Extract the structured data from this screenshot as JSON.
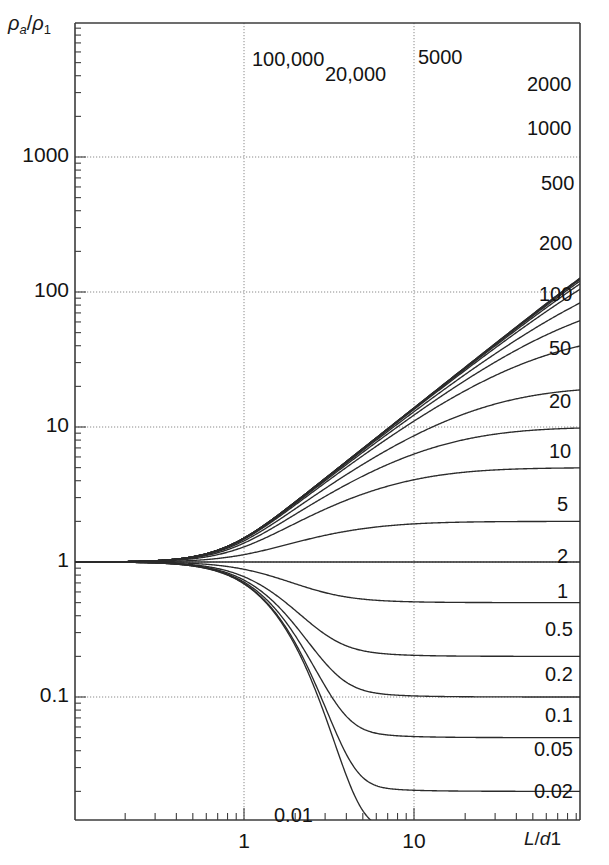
{
  "chart_data": {
    "type": "line",
    "title": "",
    "xlabel": "L/d1",
    "ylabel": "rho_a/rho_1",
    "xscale": "log",
    "yscale": "log",
    "xlim": [
      0.09,
      100
    ],
    "ylim": [
      0.005,
      20000
    ],
    "grid": true,
    "legend_position": "inline-right",
    "x_ticks": [
      {
        "value": 1,
        "label": "1"
      },
      {
        "value": 10,
        "label": "10"
      }
    ],
    "y_ticks": [
      {
        "value": 1000,
        "label": "1000"
      },
      {
        "value": 100,
        "label": "100"
      },
      {
        "value": 10,
        "label": "10"
      },
      {
        "value": 1,
        "label": "1"
      },
      {
        "value": 0.1,
        "label": "0.1"
      }
    ],
    "series": [
      {
        "name": "100,000",
        "k": 100000,
        "asymptote": 100000,
        "label_x": 252,
        "label_y": 48
      },
      {
        "name": "20,000",
        "k": 20000,
        "asymptote": 20000,
        "label_x": 325,
        "label_y": 63
      },
      {
        "name": "5000",
        "k": 5000,
        "asymptote": 5000,
        "label_x": 418,
        "label_y": 46
      },
      {
        "name": "2000",
        "k": 2000,
        "asymptote": 2000,
        "label_x": 527,
        "label_y": 73
      },
      {
        "name": "1000",
        "k": 1000,
        "asymptote": 1000,
        "label_x": 527,
        "label_y": 117
      },
      {
        "name": "500",
        "k": 500,
        "asymptote": 500,
        "label_x": 541,
        "label_y": 172
      },
      {
        "name": "200",
        "k": 200,
        "asymptote": 200,
        "label_x": 539,
        "label_y": 232
      },
      {
        "name": "100",
        "k": 100,
        "asymptote": 100,
        "label_x": 539,
        "label_y": 283
      },
      {
        "name": "50",
        "k": 50,
        "asymptote": 50,
        "label_x": 549,
        "label_y": 337
      },
      {
        "name": "20",
        "k": 20,
        "asymptote": 20,
        "label_x": 549,
        "label_y": 390
      },
      {
        "name": "10",
        "k": 10,
        "asymptote": 10,
        "label_x": 549,
        "label_y": 440
      },
      {
        "name": "5",
        "k": 5,
        "asymptote": 5,
        "label_x": 557,
        "label_y": 493
      },
      {
        "name": "2",
        "k": 2,
        "asymptote": 2,
        "label_x": 557,
        "label_y": 545
      },
      {
        "name": "1",
        "k": 1,
        "asymptote": 1,
        "label_x": 557,
        "label_y": 580
      },
      {
        "name": "0.5",
        "k": 0.5,
        "asymptote": 0.5,
        "label_x": 545,
        "label_y": 618
      },
      {
        "name": "0.2",
        "k": 0.2,
        "asymptote": 0.2,
        "label_x": 545,
        "label_y": 663
      },
      {
        "name": "0.1",
        "k": 0.1,
        "asymptote": 0.1,
        "label_x": 545,
        "label_y": 704
      },
      {
        "name": "0.05",
        "k": 0.05,
        "asymptote": 0.05,
        "label_x": 534,
        "label_y": 738
      },
      {
        "name": "0.02",
        "k": 0.02,
        "asymptote": 0.02,
        "label_x": 534,
        "label_y": 780
      },
      {
        "name": "0.01",
        "k": 0.01,
        "asymptote": 0.01,
        "label_x": 274,
        "label_y": 804
      }
    ]
  },
  "axes": {
    "y_axis_label_rho": "ρ",
    "y_axis_label_sub_a": "a",
    "y_axis_label_slash": "/",
    "y_axis_label_rho2": "ρ",
    "y_axis_label_sub_1": "1",
    "x_axis_label_L": "L",
    "x_axis_label_slash": "/",
    "x_axis_label_d": "d",
    "x_axis_label_1": "1"
  },
  "style": {
    "curve_color": "#2b2b2b",
    "axis_color": "#3c3c3c",
    "grid_color": "#8a8a8a",
    "background": "#ffffff",
    "text_color": "#141414"
  }
}
